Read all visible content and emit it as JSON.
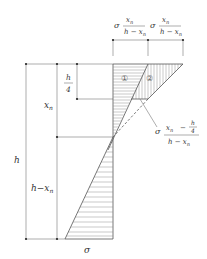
{
  "diagram": {
    "type": "stress-distribution",
    "labels": {
      "h": "h",
      "xn": "x",
      "xn_sub": "n",
      "h_minus_xn": "h−x",
      "h_minus_xn_sub": "n",
      "h_over_4_num": "h",
      "h_over_4_den": "4",
      "sigma_bottom": "σ",
      "region_1": "①",
      "region_2": "②",
      "top_left_sigma": "σ",
      "top_left_num": "x",
      "top_left_num_sub": "n",
      "top_left_den": "h − x",
      "top_left_den_sub": "n",
      "top_right_sigma": "σ",
      "top_right_num": "x",
      "top_right_num_sub": "n",
      "top_right_den": "h − x",
      "top_right_den_sub": "n",
      "callout_sigma": "σ",
      "callout_num_a": "x",
      "callout_num_a_sub": "n",
      "callout_num_minus": "−",
      "callout_num_b_num": "h",
      "callout_num_b_den": "4",
      "callout_den": "h − x",
      "callout_den_sub": "n"
    },
    "colors": {
      "line": "#555555",
      "hatch": "#888888",
      "text": "#333333"
    }
  }
}
